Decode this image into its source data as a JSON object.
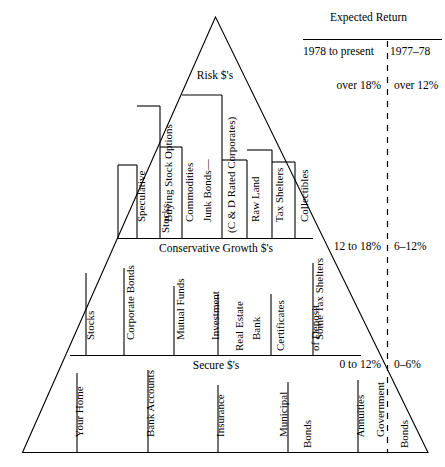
{
  "figure": {
    "type": "risk-pyramid-diagram",
    "ink_color": "#000000",
    "background": "#ffffff"
  },
  "header": {
    "title": "Expected Return",
    "column_a": "1978 to present",
    "column_b": "1977–78"
  },
  "tiers": [
    {
      "id": "risk",
      "caption": "Risk $'s",
      "return_current": "over 18%",
      "return_prior": "over 12%",
      "items": [
        {
          "label_line1": "Speculative",
          "label_line2": "Stocks"
        },
        {
          "label_line1": "Buying Stock Options",
          "label_line2": ""
        },
        {
          "label_line1": "Commodities",
          "label_line2": ""
        },
        {
          "label_line1": "Junk Bonds—",
          "label_line2": "(C & D Rated Corporates)"
        },
        {
          "label_line1": "Raw Land",
          "label_line2": ""
        },
        {
          "label_line1": "Tax Shelters",
          "label_line2": ""
        },
        {
          "label_line1": "Collectibles",
          "label_line2": ""
        }
      ]
    },
    {
      "id": "conservative-growth",
      "caption": "Conservative Growth $'s",
      "return_current": "12 to 18%",
      "return_prior": "6–12%",
      "items": [
        {
          "label_line1": "Stocks",
          "label_line2": "",
          "label_line3": ""
        },
        {
          "label_line1": "Corporate Bonds",
          "label_line2": "",
          "label_line3": ""
        },
        {
          "label_line1": "Mutual Funds",
          "label_line2": "",
          "label_line3": ""
        },
        {
          "label_line1": "Investment",
          "label_line2": "Real Estate",
          "label_line3": ""
        },
        {
          "label_line1": "Bank",
          "label_line2": "Certificates",
          "label_line3": "of Deposit"
        },
        {
          "label_line1": "Some Tax Shelters",
          "label_line2": "",
          "label_line3": ""
        }
      ]
    },
    {
      "id": "secure",
      "caption": "Secure $'s",
      "return_current": "0 to 12%",
      "return_prior": "0–6%",
      "items": [
        {
          "label_line1": "Your Home",
          "label_line2": ""
        },
        {
          "label_line1": "Bank Accounts",
          "label_line2": ""
        },
        {
          "label_line1": "Insurance",
          "label_line2": ""
        },
        {
          "label_line1": "Municipal",
          "label_line2": "Bonds"
        },
        {
          "label_line1": "Annuities",
          "label_line2": ""
        },
        {
          "label_line1": "Government",
          "label_line2": "Bonds"
        }
      ]
    }
  ]
}
